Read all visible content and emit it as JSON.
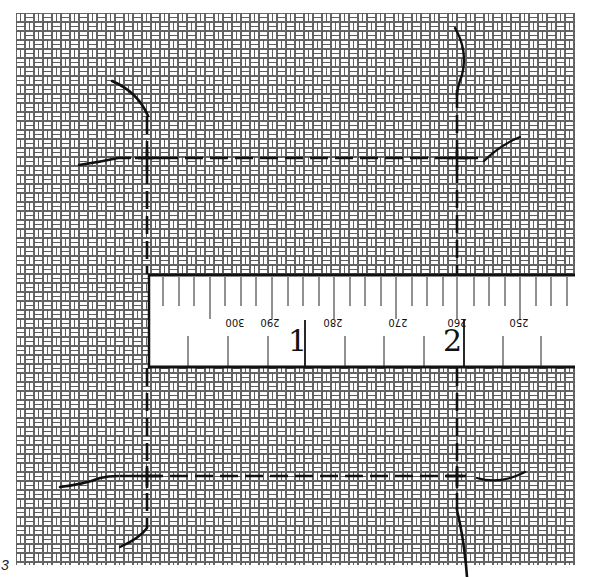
{
  "figure": {
    "label": "3",
    "colors": {
      "background": "#ffffff",
      "weave_line": "#555555",
      "mark": "#111111"
    }
  },
  "weave": {
    "pattern": "basket-weave",
    "bounds": {
      "x": 16,
      "y": 13,
      "width": 559,
      "height": 552
    }
  },
  "ruler": {
    "bounds": {
      "x": 148,
      "y": 274,
      "width": 427,
      "height": 94
    },
    "orientation": "upside-down",
    "scale_labels": [
      "300",
      "290",
      "280",
      "270",
      "260",
      "250"
    ],
    "markers": [
      {
        "label": "1"
      },
      {
        "label": "2"
      }
    ]
  },
  "guides": {
    "vertical_lines": [
      "left-dashed-line",
      "right-dashed-line"
    ],
    "horizontal_lines": [
      "top-dashed-line",
      "bottom-dashed-line"
    ],
    "style": "dashed"
  }
}
